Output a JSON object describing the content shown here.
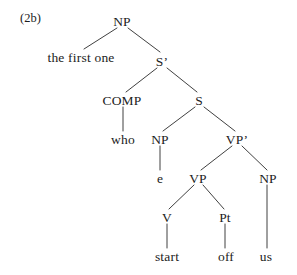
{
  "figure": {
    "example_label": "(2b)",
    "ink_color": "#1c1c1c",
    "background_color": "#ffffff"
  },
  "tree": {
    "nodes": [
      {
        "id": "np-root",
        "label": "NP",
        "x": 122,
        "y": 21
      },
      {
        "id": "s-bar",
        "label": "S’",
        "x": 162,
        "y": 61
      },
      {
        "id": "comp",
        "label": "COMP",
        "x": 122,
        "y": 100
      },
      {
        "id": "s",
        "label": "S",
        "x": 199,
        "y": 100
      },
      {
        "id": "np-subj",
        "label": "NP",
        "x": 160,
        "y": 139
      },
      {
        "id": "vp-bar",
        "label": "VP’",
        "x": 237,
        "y": 139
      },
      {
        "id": "vp",
        "label": "VP",
        "x": 198,
        "y": 178
      },
      {
        "id": "np-obj",
        "label": "NP",
        "x": 268,
        "y": 178
      },
      {
        "id": "v",
        "label": "V",
        "x": 167,
        "y": 217
      },
      {
        "id": "pt",
        "label": "Pt",
        "x": 225,
        "y": 217
      }
    ],
    "leaves": [
      {
        "id": "leaf-the-first-one",
        "label": "the first one",
        "x": 81,
        "y": 57
      },
      {
        "id": "leaf-who",
        "label": "who",
        "x": 123,
        "y": 139
      },
      {
        "id": "leaf-e",
        "label": "e",
        "x": 160,
        "y": 178
      },
      {
        "id": "leaf-start",
        "label": "start",
        "x": 167,
        "y": 256
      },
      {
        "id": "leaf-off",
        "label": "off",
        "x": 226,
        "y": 256
      },
      {
        "id": "leaf-us",
        "label": "us",
        "x": 266,
        "y": 256
      }
    ],
    "edges": [
      {
        "id": "edge-np-to-the-first-one",
        "x1": 117,
        "y1": 28,
        "x2": 84,
        "y2": 49
      },
      {
        "id": "edge-np-to-sbar",
        "x1": 128,
        "y1": 28,
        "x2": 160,
        "y2": 52
      },
      {
        "id": "edge-sbar-to-comp",
        "x1": 157,
        "y1": 68,
        "x2": 126,
        "y2": 92
      },
      {
        "id": "edge-sbar-to-s",
        "x1": 167,
        "y1": 68,
        "x2": 197,
        "y2": 92
      },
      {
        "id": "edge-comp-to-who",
        "x1": 123,
        "y1": 107,
        "x2": 123,
        "y2": 131
      },
      {
        "id": "edge-s-to-np",
        "x1": 195,
        "y1": 107,
        "x2": 163,
        "y2": 131
      },
      {
        "id": "edge-s-to-vpbar",
        "x1": 204,
        "y1": 107,
        "x2": 235,
        "y2": 131
      },
      {
        "id": "edge-np-to-e",
        "x1": 160,
        "y1": 146,
        "x2": 160,
        "y2": 170
      },
      {
        "id": "edge-vpbar-to-vp",
        "x1": 232,
        "y1": 146,
        "x2": 201,
        "y2": 170
      },
      {
        "id": "edge-vpbar-to-np",
        "x1": 242,
        "y1": 146,
        "x2": 267,
        "y2": 170
      },
      {
        "id": "edge-vp-to-v",
        "x1": 194,
        "y1": 185,
        "x2": 169,
        "y2": 209
      },
      {
        "id": "edge-vp-to-pt",
        "x1": 203,
        "y1": 185,
        "x2": 224,
        "y2": 209
      },
      {
        "id": "edge-v-to-start",
        "x1": 167,
        "y1": 224,
        "x2": 167,
        "y2": 248
      },
      {
        "id": "edge-pt-to-off",
        "x1": 225,
        "y1": 224,
        "x2": 225,
        "y2": 248
      },
      {
        "id": "edge-npobj-to-us",
        "x1": 267,
        "y1": 185,
        "x2": 267,
        "y2": 248
      }
    ]
  }
}
